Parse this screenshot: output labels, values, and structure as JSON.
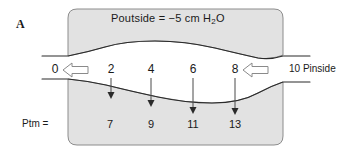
{
  "figure": {
    "panel_letter": "A",
    "title": {
      "prefix": "Poutside  =  −5 cm H",
      "subscript": "2",
      "suffix": "O"
    },
    "outside_pressure_value": "−5",
    "outside_pressure_units": "cm H2O",
    "airway_label_left": "0",
    "pinside_label": "10 Pinside",
    "ptm_label": "Ptm  =",
    "flow_numbers": [
      {
        "value": "0",
        "x": 55
      },
      {
        "value": "2",
        "x": 111
      },
      {
        "value": "4",
        "x": 151
      },
      {
        "value": "6",
        "x": 193
      },
      {
        "value": "8",
        "x": 235
      },
      {
        "value": "10",
        "x": 296
      }
    ],
    "ptm_numbers": [
      {
        "value": "7",
        "x": 110
      },
      {
        "value": "9",
        "x": 151
      },
      {
        "value": "11",
        "x": 193
      },
      {
        "value": "13",
        "x": 235
      }
    ],
    "down_arrows": [
      {
        "x": 111,
        "top": 78,
        "bottom": 98
      },
      {
        "x": 151,
        "top": 78,
        "bottom": 106
      },
      {
        "x": 193,
        "top": 78,
        "bottom": 113
      },
      {
        "x": 235,
        "top": 78,
        "bottom": 114
      }
    ],
    "flow_arrows": [
      {
        "name": "left-flow-arrow",
        "x": 64,
        "y": 70
      },
      {
        "name": "right-flow-arrow",
        "x": 243,
        "y": 70
      }
    ],
    "colors": {
      "tissue_fill": "#e2e2e2",
      "tissue_stroke": "#8c8c8c",
      "airway_wall": "#2a2a2a",
      "arrow_stroke": "#6e6e6e",
      "text": "#1a1a1a",
      "background": "#ffffff"
    }
  }
}
